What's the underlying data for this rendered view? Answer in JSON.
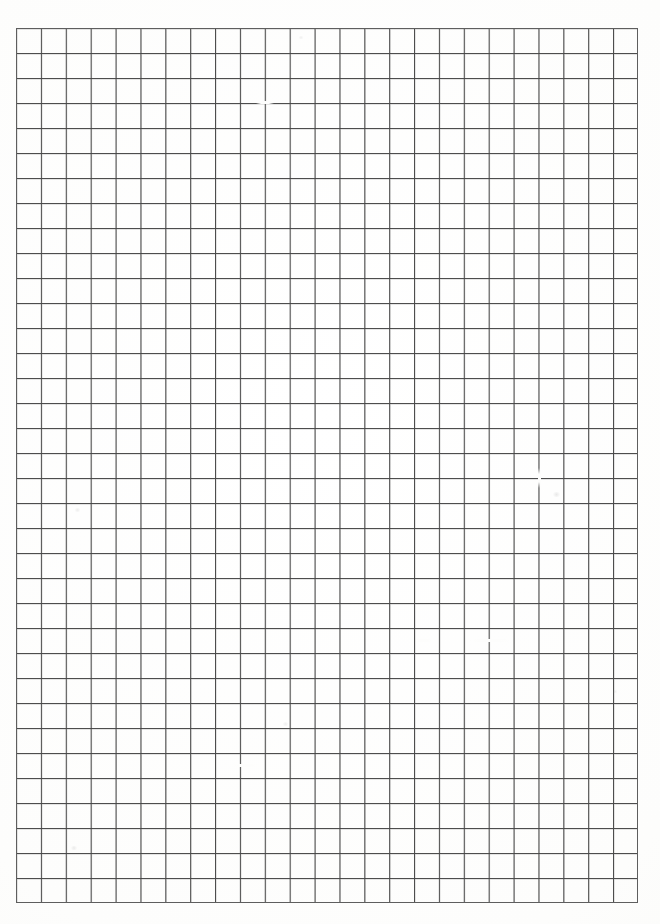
{
  "document": {
    "kind": "graph-paper-sheet",
    "description": "Blank scanned sheet of squared graph paper",
    "visible_text": "",
    "annotations": []
  },
  "canvas": {
    "width": 660,
    "height": 924,
    "background_color": "#fefefd",
    "paper_color": "#fdfdfc"
  },
  "chart_data": {
    "type": "table",
    "title": "",
    "xlabel": "",
    "ylabel": "",
    "columns": 25,
    "rows": 35,
    "cell_width_px": 24.88,
    "cell_height_px": 25.0,
    "grid": true,
    "legend": "none",
    "categories": [],
    "values": []
  },
  "grid": {
    "origin_x": 16,
    "origin_y": 28,
    "right_edge_x": 638,
    "bottom_edge_y": 903,
    "width": 622,
    "height": 875,
    "columns": 25,
    "rows": 35,
    "cell_width": 24.88,
    "cell_height": 25.0,
    "line_color": "#565656",
    "line_color_soft": "#8d8d8d",
    "line_width": 1,
    "border_color": "#5e5e5e"
  },
  "margins": {
    "left": 16,
    "top": 28,
    "right": 22,
    "bottom": 21
  },
  "artifacts": {
    "faded_line_segments": [
      {
        "name": "faded-horizontal-gap-row-24",
        "x": 470,
        "y": 639,
        "width": 42,
        "height": 3
      },
      {
        "name": "faded-horizontal-gap-row-24b",
        "x": 416,
        "y": 639,
        "width": 16,
        "height": 3
      },
      {
        "name": "faded-horizontal-gap-row-29",
        "x": 232,
        "y": 764,
        "width": 26,
        "height": 3
      },
      {
        "name": "faded-vertical-gap-col-21",
        "x": 538,
        "y": 468,
        "width": 3,
        "height": 20
      },
      {
        "name": "faded-horizontal-gap-row-3",
        "x": 256,
        "y": 101,
        "width": 18,
        "height": 3
      }
    ],
    "smudges": [
      {
        "name": "smudge-upper-right",
        "x": 552,
        "y": 492,
        "size": 9,
        "color": "rgba(150,150,150,0.20)"
      },
      {
        "name": "smudge-mid-left",
        "x": 74,
        "y": 508,
        "size": 7,
        "color": "rgba(150,150,150,0.16)"
      },
      {
        "name": "smudge-lower-left",
        "x": 70,
        "y": 846,
        "size": 8,
        "color": "rgba(150,150,150,0.18)"
      },
      {
        "name": "smudge-center",
        "x": 282,
        "y": 722,
        "size": 7,
        "color": "rgba(150,150,150,0.15)"
      },
      {
        "name": "smudge-top-center",
        "x": 298,
        "y": 36,
        "size": 6,
        "color": "rgba(150,150,150,0.14)"
      },
      {
        "name": "smudge-right-edge",
        "x": 612,
        "y": 690,
        "size": 6,
        "color": "rgba(150,150,150,0.13)"
      }
    ]
  }
}
